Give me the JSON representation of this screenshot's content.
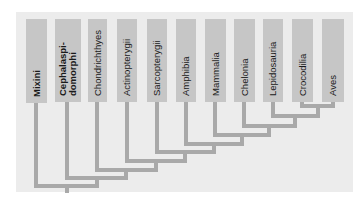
{
  "diagram": {
    "type": "cladogram",
    "colors": {
      "background": "#ffffff",
      "panel": "#ececec",
      "taxon_box": "#c6c6c6",
      "branch": "#a9a9a9",
      "text": "#1a1a1a"
    },
    "taxa": [
      {
        "label": "Mixini",
        "bold": true,
        "x": 26,
        "w": 21,
        "stem": 36
      },
      {
        "label": "Cephalaspi-\ndomorphi",
        "bold": true,
        "x": 55,
        "w": 26,
        "stem": 67
      },
      {
        "label": "Chondrichthyes",
        "bold": false,
        "x": 88,
        "w": 19,
        "stem": 97
      },
      {
        "label": "Actinopterygii",
        "bold": false,
        "x": 117,
        "w": 20,
        "stem": 127
      },
      {
        "label": "Sarcopterygii",
        "bold": false,
        "x": 147,
        "w": 20,
        "stem": 157
      },
      {
        "label": "Amphibia",
        "bold": false,
        "x": 176,
        "w": 20,
        "stem": 186
      },
      {
        "label": "Mammalia",
        "bold": false,
        "x": 205,
        "w": 21,
        "stem": 215
      },
      {
        "label": "Chelonia",
        "bold": false,
        "x": 234,
        "w": 21,
        "stem": 244
      },
      {
        "label": "Lepidosauria",
        "bold": false,
        "x": 263,
        "w": 20,
        "stem": 273
      },
      {
        "label": "Crocodilia",
        "bold": false,
        "x": 292,
        "w": 21,
        "stem": 302
      },
      {
        "label": "Aves",
        "bold": false,
        "x": 322,
        "w": 22,
        "stem": 333
      }
    ]
  }
}
